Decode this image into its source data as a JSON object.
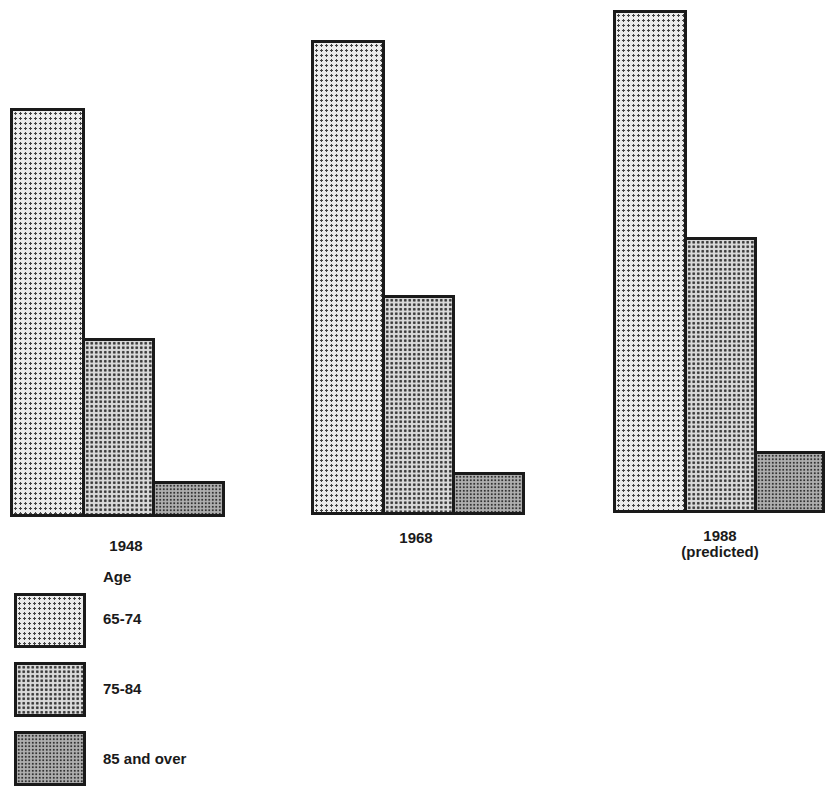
{
  "chart_data": {
    "type": "bar",
    "title": "",
    "xlabel": "",
    "ylabel": "",
    "y_axis_shown": false,
    "grid": false,
    "units": "relative bar height (no scale shown; proportional to pixel height)",
    "categories": [
      "1948",
      "1968",
      "1988 (predicted)"
    ],
    "category_labels": [
      {
        "line1": "1948",
        "line2": ""
      },
      {
        "line1": "1968",
        "line2": ""
      },
      {
        "line1": "1988",
        "line2": "(predicted)"
      }
    ],
    "series": [
      {
        "name": "65-74",
        "values": [
          409,
          475,
          503
        ]
      },
      {
        "name": "75-84",
        "values": [
          179,
          220,
          276
        ]
      },
      {
        "name": "85 and over",
        "values": [
          36,
          43,
          62
        ]
      }
    ],
    "legend": {
      "title": "Age",
      "position": "bottom-left",
      "entries": [
        "65-74",
        "75-84",
        "85 and over"
      ]
    }
  },
  "groups": [
    {
      "baseline": 517,
      "x": [
        10,
        82,
        152
      ],
      "w": [
        72,
        70,
        70
      ]
    },
    {
      "baseline": 515,
      "x": [
        311,
        382,
        452
      ],
      "w": [
        71,
        70,
        70
      ]
    },
    {
      "baseline": 513,
      "x": [
        613,
        684,
        754
      ],
      "w": [
        71,
        70,
        68
      ]
    }
  ]
}
